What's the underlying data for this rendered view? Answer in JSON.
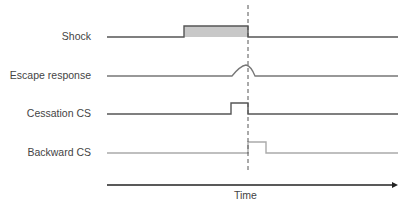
{
  "diagram": {
    "rows": [
      {
        "label": "Shock",
        "color": "#555555"
      },
      {
        "label": "Escape response",
        "color": "#777777"
      },
      {
        "label": "Cessation CS",
        "color": "#555555"
      },
      {
        "label": "Backward CS",
        "color": "#aaaaaa"
      }
    ],
    "axis_label": "Time",
    "shock_fill": "#c8c8c8",
    "marker": "dashed line at shock offset"
  }
}
